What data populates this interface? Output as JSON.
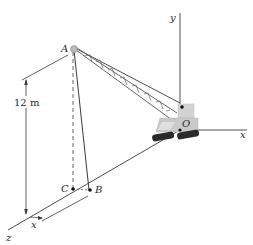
{
  "figure": {
    "points": {
      "A": "A",
      "B": "B",
      "C": "C",
      "O": "O"
    },
    "axes": {
      "x": "x",
      "y": "y",
      "z": "z"
    },
    "dimensions": {
      "height": "12 m",
      "offset": "x"
    },
    "colors": {
      "line": "#3a3a3a",
      "crane_body": "#c9c9c9",
      "tracks": "#2b2b2b",
      "boom": "#555555"
    }
  }
}
